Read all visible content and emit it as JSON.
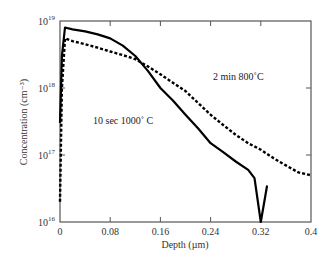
{
  "chart_data": {
    "type": "line",
    "title": "",
    "xlabel": "Depth (µm)",
    "ylabel": "Concentration (cm⁻³)",
    "xlim": [
      0,
      0.4
    ],
    "ylim": [
      1e+16,
      1e+19
    ],
    "yscale": "log",
    "grid": false,
    "x_ticks": [
      "0",
      "0.08",
      "0.16",
      "0.24",
      "0.32",
      "0.4"
    ],
    "y_ticks": [
      {
        "base": "10",
        "exp": "16",
        "value": 1e+16
      },
      {
        "base": "10",
        "exp": "17",
        "value": 1e+17
      },
      {
        "base": "10",
        "exp": "18",
        "value": 1e+18
      },
      {
        "base": "10",
        "exp": "19",
        "value": 1e+19
      }
    ],
    "series": [
      {
        "name": "10 sec 1000˚ C",
        "style": "solid",
        "x": [
          0.0,
          0.003,
          0.008,
          0.02,
          0.04,
          0.06,
          0.08,
          0.1,
          0.12,
          0.14,
          0.16,
          0.18,
          0.2,
          0.22,
          0.24,
          0.26,
          0.28,
          0.3,
          0.31,
          0.32,
          0.33
        ],
        "y": [
          3e+17,
          3e+18,
          8e+18,
          7.5e+18,
          7e+18,
          6.3e+18,
          5.5e+18,
          4.3e+18,
          3e+18,
          1.8e+18,
          1e+18,
          6.5e+17,
          4e+17,
          2.5e+17,
          1.5e+17,
          1.1e+17,
          8e+16,
          6e+16,
          4.5e+16,
          1e+16,
          3.5e+16
        ]
      },
      {
        "name": "2 min 800˚C",
        "style": "dashed",
        "x": [
          0.0,
          0.003,
          0.008,
          0.02,
          0.04,
          0.06,
          0.08,
          0.1,
          0.12,
          0.14,
          0.16,
          0.18,
          0.2,
          0.22,
          0.24,
          0.26,
          0.28,
          0.3,
          0.32,
          0.34,
          0.36,
          0.38,
          0.4
        ],
        "y": [
          2e+16,
          1e+18,
          5.5e+18,
          5e+18,
          4.5e+18,
          4e+18,
          3.5e+18,
          3.1e+18,
          2.7e+18,
          2.1e+18,
          1.6e+18,
          1.2e+18,
          9e+17,
          6e+17,
          4e+17,
          2.8e+17,
          2e+17,
          1.5e+17,
          1.2e+17,
          9e+16,
          7e+16,
          5.5e+16,
          5e+16
        ]
      }
    ],
    "annotations": [
      {
        "text": "2 min 800˚C",
        "x": 0.24,
        "y": 1.3e+18
      },
      {
        "text": "10 sec 1000˚ C",
        "x": 0.07,
        "y": 3.5e+17
      }
    ],
    "legend": "none (inline annotations)"
  }
}
